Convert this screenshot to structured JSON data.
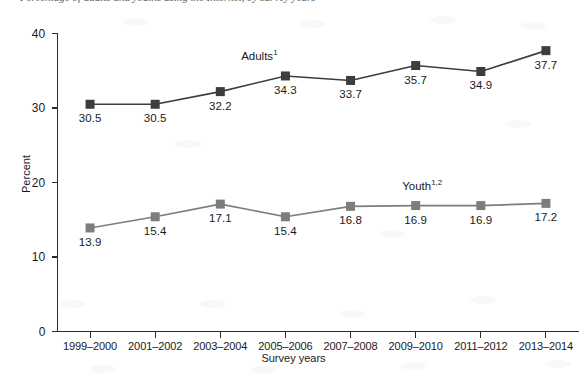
{
  "figure": {
    "top_caption_partial": "Percentage of adults and youths using the Internet, by survey years",
    "background_color": "#ffffff"
  },
  "chart_data": {
    "type": "line",
    "title": "",
    "subtitle": "",
    "xlabel": "Survey years",
    "ylabel": "Percent",
    "categories": [
      "1999–2000",
      "2001–2002",
      "2003–2004",
      "2005–2006",
      "2007–2008",
      "2009–2010",
      "2011–2012",
      "2013–2014"
    ],
    "series": [
      {
        "name": "Adults",
        "label_text": "Adults",
        "label_superscript": "1",
        "color": "#3d3d3d",
        "marker": "square",
        "values": [
          30.5,
          30.5,
          32.2,
          34.3,
          33.7,
          35.7,
          34.9,
          37.7
        ],
        "value_labels": [
          "30.5",
          "30.5",
          "32.2",
          "34.3",
          "33.7",
          "35.7",
          "34.9",
          "37.7"
        ],
        "label_positions": [
          "below",
          "below",
          "below",
          "below",
          "below",
          "below",
          "below",
          "below"
        ]
      },
      {
        "name": "Youth",
        "label_text": "Youth",
        "label_superscript": "1,2",
        "color": "#7d7d7d",
        "marker": "square",
        "values": [
          13.9,
          15.4,
          17.1,
          15.4,
          16.8,
          16.9,
          16.9,
          17.2
        ],
        "value_labels": [
          "13.9",
          "15.4",
          "17.1",
          "15.4",
          "16.8",
          "16.9",
          "16.9",
          "17.2"
        ],
        "label_positions": [
          "below",
          "below",
          "below",
          "below",
          "below",
          "below",
          "below",
          "below"
        ]
      }
    ],
    "ylim": [
      0,
      40
    ],
    "yticks": [
      0,
      10,
      20,
      30,
      40
    ],
    "ytick_labels": [
      "0",
      "10",
      "20",
      "30",
      "40"
    ],
    "grid": false,
    "legend_position": "inline-series-labels",
    "annotations": [
      {
        "text": "Adults",
        "superscript": "1",
        "series": "Adults"
      },
      {
        "text": "Youth",
        "superscript": "1,2",
        "series": "Youth"
      }
    ]
  }
}
